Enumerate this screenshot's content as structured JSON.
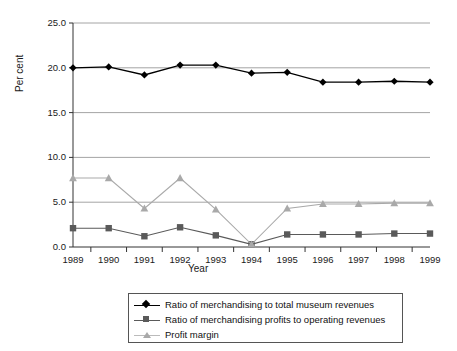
{
  "chart_data": {
    "type": "line",
    "title": "",
    "xlabel": "Year",
    "ylabel": "Per cent",
    "categories": [
      "1989",
      "1990",
      "1991",
      "1992",
      "1993",
      "1994",
      "1995",
      "1996",
      "1997",
      "1998",
      "1999"
    ],
    "ylim": [
      0,
      25
    ],
    "yticks": [
      "0.0",
      "5.0",
      "10.0",
      "15.0",
      "20.0",
      "25.0"
    ],
    "ytick_values": [
      0,
      5,
      10,
      15,
      20,
      25
    ],
    "grid": "horizontal",
    "legend_position": "bottom",
    "series": [
      {
        "name": "Ratio of merchandising to total museum revenues",
        "marker": "diamond",
        "color": "#000000",
        "values": [
          20.0,
          20.1,
          19.2,
          20.3,
          20.3,
          19.4,
          19.5,
          18.4,
          18.4,
          18.5,
          18.4
        ]
      },
      {
        "name": "Ratio of merchandising profits to operating revenues",
        "marker": "square",
        "color": "#5a5a5a",
        "values": [
          2.1,
          2.1,
          1.2,
          2.2,
          1.3,
          0.3,
          1.4,
          1.4,
          1.4,
          1.5,
          1.5
        ]
      },
      {
        "name": "Profit margin",
        "marker": "triangle",
        "color": "#a9a9a9",
        "values": [
          7.7,
          7.7,
          4.3,
          7.7,
          4.2,
          0.3,
          4.3,
          4.8,
          4.8,
          4.9,
          4.9
        ]
      }
    ]
  },
  "axes": {
    "ylabel_title": "Per cent",
    "xlabel_title": "Year"
  }
}
